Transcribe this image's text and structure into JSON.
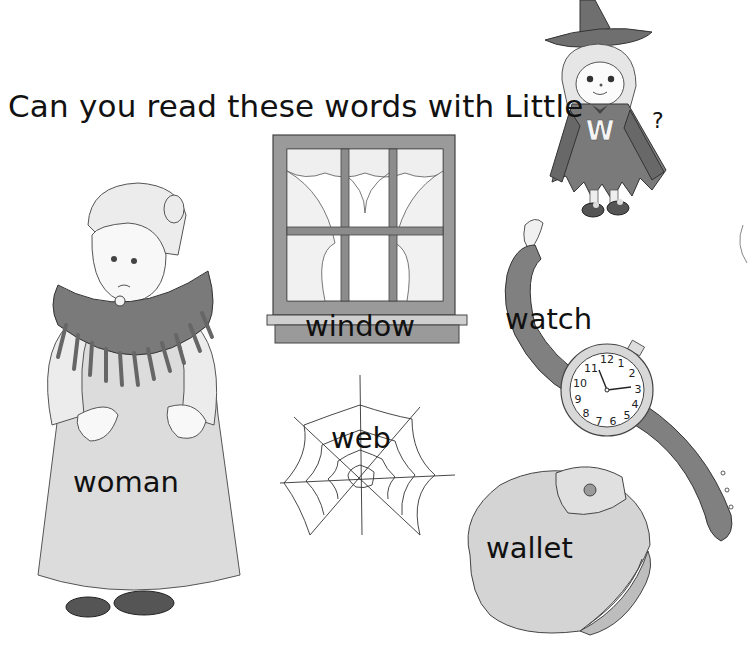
{
  "page": {
    "title": "Can you read these words with Little",
    "title_suffix": "?",
    "mascot": {
      "name": "Little W",
      "letter": "W"
    }
  },
  "words": [
    {
      "id": "window",
      "label": "window",
      "picture": "window-icon"
    },
    {
      "id": "watch",
      "label": "watch",
      "picture": "watch-icon"
    },
    {
      "id": "woman",
      "label": "woman",
      "picture": "woman-icon"
    },
    {
      "id": "web",
      "label": "web",
      "picture": "spider-web-icon"
    },
    {
      "id": "wallet",
      "label": "wallet",
      "picture": "wallet-icon"
    }
  ],
  "watch_face": {
    "numbers": [
      "12",
      "1",
      "2",
      "3",
      "4",
      "5",
      "6",
      "7",
      "8",
      "9",
      "10",
      "11"
    ]
  },
  "colors": {
    "ink": "#111111",
    "grey_dark": "#6f6f6f",
    "grey_mid": "#9a9a9a",
    "grey_light": "#d4d4d4",
    "paper": "#ffffff"
  }
}
